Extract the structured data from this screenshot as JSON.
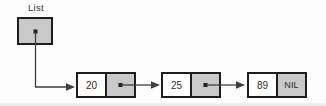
{
  "diagram": {
    "type": "singly-linked-list",
    "head_label": "List",
    "nodes": [
      {
        "value": "20"
      },
      {
        "value": "25"
      },
      {
        "value": "89"
      }
    ],
    "nil_label": "NIL",
    "colors": {
      "box_fill_gray": "#c9c9c9",
      "box_border": "#1e1e1e",
      "arrow": "#3f3f3f",
      "value_cell_fill": "#ffffff",
      "background": "#fdfdfd",
      "text": "#2f2f2f"
    }
  }
}
